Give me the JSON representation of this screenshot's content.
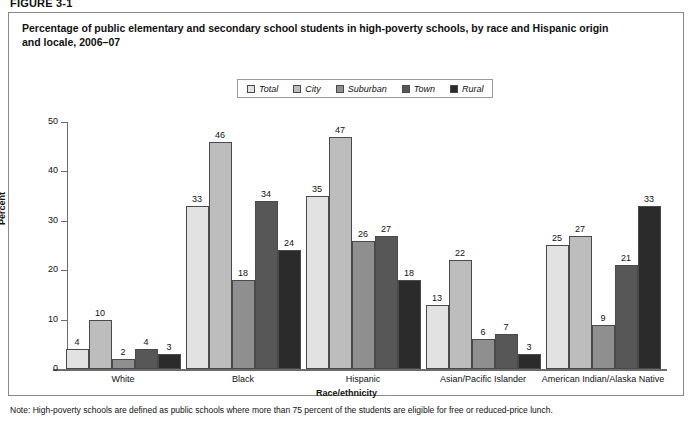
{
  "figure_label": "FIGURE 3-1",
  "title": "Percentage of public elementary and secondary school students in high-poverty schools, by race and Hispanic origin and locale, 2006–07",
  "note": "Note: High-poverty schools are defined as public schools where more than 75 percent of the students are eligible for free or reduced-price lunch.",
  "legend": {
    "items": [
      {
        "label": "Total",
        "color": "#e2e2e2"
      },
      {
        "label": "City",
        "color": "#bdbdbd"
      },
      {
        "label": "Suburban",
        "color": "#8f8f8f"
      },
      {
        "label": "Town",
        "color": "#575757"
      },
      {
        "label": "Rural",
        "color": "#2b2b2b"
      }
    ]
  },
  "chart_data": {
    "type": "bar",
    "title": "Percentage of public elementary and secondary school students in high-poverty schools, by race and Hispanic origin and locale, 2006–07",
    "xlabel": "Race/ethnicity",
    "ylabel": "Percent",
    "ylim": [
      0,
      50
    ],
    "yticks": [
      0,
      10,
      20,
      30,
      40,
      50
    ],
    "grid": false,
    "legend_position": "top-center",
    "categories": [
      "White",
      "Black",
      "Hispanic",
      "Asian/Pacific Islander",
      "American Indian/Alaska Native"
    ],
    "series": [
      {
        "name": "Total",
        "color": "#e2e2e2",
        "values": [
          4,
          33,
          35,
          13,
          25
        ]
      },
      {
        "name": "City",
        "color": "#bdbdbd",
        "values": [
          10,
          46,
          47,
          22,
          27
        ]
      },
      {
        "name": "Suburban",
        "color": "#8f8f8f",
        "values": [
          2,
          18,
          26,
          6,
          9
        ]
      },
      {
        "name": "Town",
        "color": "#575757",
        "values": [
          4,
          34,
          27,
          7,
          21
        ]
      },
      {
        "name": "Rural",
        "color": "#2b2b2b",
        "values": [
          3,
          24,
          18,
          3,
          33
        ]
      }
    ]
  }
}
